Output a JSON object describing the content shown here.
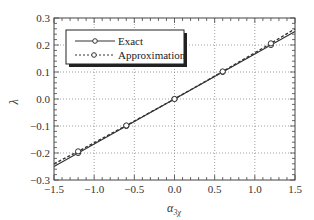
{
  "chart_data": {
    "type": "line",
    "title": "",
    "xlabel": "α_3χ",
    "xlabel_main": "α",
    "xlabel_sub": "3χ",
    "ylabel": "λ",
    "xlim": [
      -1.5,
      1.5
    ],
    "ylim": [
      -0.3,
      0.3
    ],
    "grid": true,
    "grid_style": "dotted",
    "legend_position": "upper left",
    "x_ticks": [
      -1.5,
      -1.0,
      -0.5,
      0.0,
      0.5,
      1.0,
      1.5
    ],
    "x_tick_labels": [
      "−1.5",
      "−1.0",
      "−0.5",
      "0.0",
      "0.5",
      "1.0",
      "1.5"
    ],
    "y_ticks": [
      -0.3,
      -0.2,
      -0.1,
      0.0,
      0.1,
      0.2,
      0.3
    ],
    "y_tick_labels": [
      "−0.3",
      "−0.2",
      "−0.1",
      "0.0",
      "0.1",
      "0.2",
      "0.3"
    ],
    "series": [
      {
        "name": "Exact",
        "style": "solid",
        "marker": "open-circle",
        "x": [
          -1.5,
          -1.2,
          -0.6,
          0.0,
          0.6,
          1.2,
          1.5
        ],
        "values": [
          -0.25,
          -0.2,
          -0.1,
          0.0,
          0.1,
          0.2,
          0.25
        ],
        "marker_x": [
          -1.2,
          -0.6,
          0.0,
          0.6,
          1.2
        ],
        "marker_values": [
          -0.2,
          -0.1,
          0.0,
          0.1,
          0.2
        ]
      },
      {
        "name": "Approximation",
        "style": "dashed",
        "marker": "open-circle",
        "x": [
          -1.5,
          -1.2,
          -0.6,
          0.0,
          0.6,
          1.2,
          1.5
        ],
        "values": [
          -0.24,
          -0.194,
          -0.098,
          0.0,
          0.102,
          0.206,
          0.26
        ],
        "marker_x": [
          -1.2,
          -0.6,
          0.0,
          0.6,
          1.2
        ],
        "marker_values": [
          -0.194,
          -0.098,
          0.0,
          0.102,
          0.206
        ]
      }
    ]
  },
  "legend": {
    "items": [
      {
        "label": "Exact"
      },
      {
        "label": "Approximation"
      }
    ]
  },
  "colors": {
    "line": "#333333",
    "grid": "#888888",
    "frame": "#444444"
  }
}
